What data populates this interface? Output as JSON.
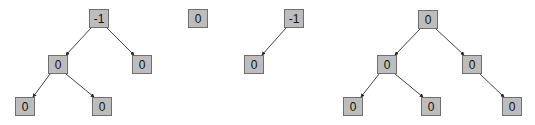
{
  "diagram": {
    "colors": {
      "node_fill": "#bdbdbd",
      "node_border": "#6e6e6e",
      "edge": "#444444"
    },
    "trees": [
      {
        "name": "tree-1",
        "nodes": [
          {
            "id": "t1-root",
            "label": "-1",
            "x": 89,
            "y": 9
          },
          {
            "id": "t1-l",
            "label": "0",
            "x": 48,
            "y": 55
          },
          {
            "id": "t1-r",
            "label": "0",
            "x": 132,
            "y": 55
          },
          {
            "id": "t1-ll",
            "label": "0",
            "x": 15,
            "y": 97
          },
          {
            "id": "t1-lr",
            "label": "0",
            "x": 92,
            "y": 97
          }
        ],
        "edges": [
          [
            "t1-root",
            "t1-l"
          ],
          [
            "t1-root",
            "t1-r"
          ],
          [
            "t1-l",
            "t1-ll"
          ],
          [
            "t1-l",
            "t1-lr"
          ]
        ]
      },
      {
        "name": "tree-2",
        "nodes": [
          {
            "id": "t2-root",
            "label": "0",
            "x": 188,
            "y": 9
          }
        ],
        "edges": []
      },
      {
        "name": "tree-3",
        "nodes": [
          {
            "id": "t3-root",
            "label": "-1",
            "x": 284,
            "y": 9
          },
          {
            "id": "t3-l",
            "label": "0",
            "x": 244,
            "y": 55
          }
        ],
        "edges": [
          [
            "t3-root",
            "t3-l"
          ]
        ]
      },
      {
        "name": "tree-4",
        "nodes": [
          {
            "id": "t4-root",
            "label": "0",
            "x": 418,
            "y": 10
          },
          {
            "id": "t4-l",
            "label": "0",
            "x": 377,
            "y": 55
          },
          {
            "id": "t4-r",
            "label": "0",
            "x": 462,
            "y": 55
          },
          {
            "id": "t4-ll",
            "label": "0",
            "x": 343,
            "y": 97
          },
          {
            "id": "t4-lr",
            "label": "0",
            "x": 421,
            "y": 97
          },
          {
            "id": "t4-rr",
            "label": "0",
            "x": 502,
            "y": 97
          }
        ],
        "edges": [
          [
            "t4-root",
            "t4-l"
          ],
          [
            "t4-root",
            "t4-r"
          ],
          [
            "t4-l",
            "t4-ll"
          ],
          [
            "t4-l",
            "t4-lr"
          ],
          [
            "t4-r",
            "t4-rr"
          ]
        ]
      }
    ]
  }
}
